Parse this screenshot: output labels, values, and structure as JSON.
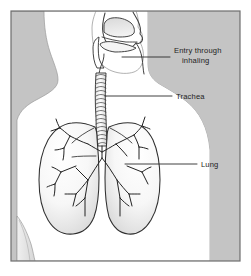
{
  "figure": {
    "frame_color": "#6e6e6e",
    "background_color": "#c4c4c4",
    "body_color": "#ffffff",
    "outline_color": "#3a3a3a",
    "leader_color": "#2b2b2b",
    "text_color": "#1d1d1d",
    "page_color": "#ffffff"
  },
  "labels": [
    {
      "id": "entry-through-inhaling",
      "name": "Entry through inhaling",
      "line1": "Entry through",
      "line2": "inhaling",
      "leader_from_x": 122,
      "leader_to_x": 170,
      "leader_y": 57
    },
    {
      "id": "trachea",
      "name": "Trachea",
      "line1": "Trachea",
      "line2": "",
      "leader_from_x": 105,
      "leader_to_x": 172,
      "leader_y": 96
    },
    {
      "id": "lung",
      "name": "Lung",
      "line1": "Lung",
      "line2": "",
      "leader_from_x": 125,
      "leader_to_x": 197,
      "leader_y": 164
    }
  ],
  "anatomy": {
    "head": "head-profile",
    "nasal_cavity": "nasal-cavity",
    "tongue": "tongue",
    "oral_cavity": "oral-cavity",
    "trachea": "trachea-cartilage-rings",
    "left_lung": "left-lung",
    "right_lung": "right-lung",
    "bronchial_tree": "bronchial-tree",
    "torso": "torso-silhouette",
    "arm": "arm-silhouette"
  }
}
